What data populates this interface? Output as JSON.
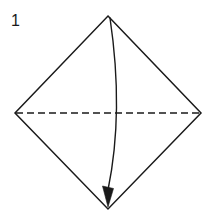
{
  "diagram": {
    "kind": "origami-step-diagram",
    "step_label": "1",
    "background_color": "#ffffff",
    "line_color": "#1a1a1a",
    "fold_line_color": "#1a1a1a",
    "arrow_color": "#1a1a1a",
    "shape": {
      "name": "square-rotated-45-diamond",
      "vertices": {
        "top": [
          108,
          16
        ],
        "right": [
          201,
          113
        ],
        "bottom": [
          108,
          209
        ],
        "left": [
          15,
          113
        ]
      },
      "stroke_width": 1.5,
      "fill": "none"
    },
    "fold_line": {
      "name": "horizontal-dashed-fold-line",
      "style": "dashed",
      "from": [
        15,
        113
      ],
      "to": [
        201,
        113
      ],
      "dash_length": 7,
      "dash_gap": 4,
      "stroke_width": 1.4
    },
    "arrow": {
      "name": "fold-direction-arrow",
      "style": "curved-solid-with-filled-head",
      "from": [
        110,
        18
      ],
      "to": [
        108,
        205
      ],
      "control_point": [
        124,
        112
      ],
      "bulge_direction": "right",
      "stroke_width": 1.4,
      "head": {
        "type": "filled-triangle",
        "points": "103,188 113,188 108,207",
        "direction": "down"
      }
    }
  }
}
